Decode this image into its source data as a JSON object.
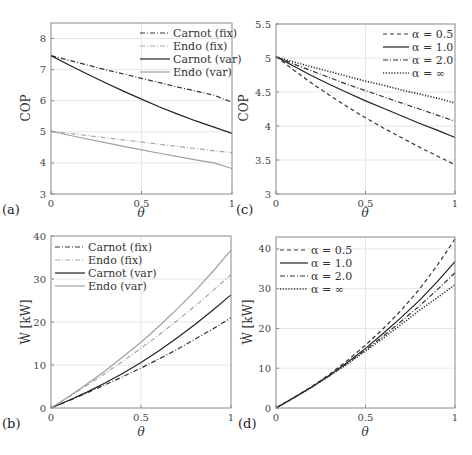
{
  "figure": {
    "width": 472,
    "height": 455,
    "grid_color": "#e6e6e6",
    "axes_color": "#8a8a8a"
  },
  "chart_data": [
    {
      "id": "a",
      "panel_label": "(a)",
      "type": "line",
      "title": "",
      "xlabel": "θ",
      "ylabel": "COP",
      "xlim": [
        0,
        1
      ],
      "ylim": [
        3,
        8.5
      ],
      "xticks": [
        0,
        0.5,
        1
      ],
      "xtick_labels": [
        "0",
        "0.5",
        "1"
      ],
      "yticks": [
        3,
        4,
        5,
        6,
        7,
        8
      ],
      "ytick_labels": [
        "3",
        "4",
        "5",
        "6",
        "7",
        "8"
      ],
      "grid": true,
      "legend_position": "upper right",
      "box": {
        "x0": 51,
        "x1": 232,
        "y0": 23,
        "y1": 194
      },
      "label_pos": {
        "x": 2,
        "y": 214
      },
      "xlabel_pos": {
        "x": 141,
        "y": 217
      },
      "ylabel_pos": {
        "x": 30,
        "y": 108
      },
      "legend_box": {
        "x": 140,
        "y": 27,
        "line_len": 30,
        "row_h": 13
      },
      "x": [
        0,
        0.1,
        0.2,
        0.3,
        0.4,
        0.5,
        0.6,
        0.7,
        0.8,
        0.9,
        1.0
      ],
      "series": [
        {
          "name": "Carnot (fix)",
          "style": "dashdot",
          "color": "#333333",
          "values": [
            7.45,
            7.3,
            7.15,
            7.0,
            6.86,
            6.72,
            6.58,
            6.44,
            6.31,
            6.18,
            5.95
          ]
        },
        {
          "name": "Endo (fix)",
          "style": "dashdot",
          "color": "#a8a8a8",
          "values": [
            5.02,
            4.95,
            4.88,
            4.81,
            4.74,
            4.67,
            4.6,
            4.53,
            4.46,
            4.39,
            4.33
          ]
        },
        {
          "name": "Carnot (var)",
          "style": "solid",
          "color": "#222222",
          "values": [
            7.45,
            7.15,
            6.86,
            6.58,
            6.31,
            6.05,
            5.8,
            5.57,
            5.35,
            5.15,
            4.95
          ]
        },
        {
          "name": "Endo (var)",
          "style": "solid",
          "color": "#a0a0a0",
          "values": [
            5.02,
            4.89,
            4.77,
            4.65,
            4.53,
            4.42,
            4.31,
            4.2,
            4.1,
            4.0,
            3.82
          ]
        }
      ]
    },
    {
      "id": "c",
      "panel_label": "(c)",
      "type": "line",
      "title": "",
      "xlabel": "θ",
      "ylabel": "COP",
      "xlim": [
        0,
        1
      ],
      "ylim": [
        3,
        5.5
      ],
      "xticks": [
        0,
        0.5,
        1
      ],
      "xtick_labels": [
        "0",
        "0.5",
        "1"
      ],
      "yticks": [
        3,
        3.5,
        4,
        4.5,
        5,
        5.5
      ],
      "ytick_labels": [
        "3",
        "3.5",
        "4",
        "4.5",
        "5",
        "5.5"
      ],
      "grid": true,
      "legend_position": "upper right",
      "box": {
        "x0": 276,
        "x1": 455,
        "y0": 24,
        "y1": 194
      },
      "label_pos": {
        "x": 236,
        "y": 214
      },
      "xlabel_pos": {
        "x": 365,
        "y": 217
      },
      "ylabel_pos": {
        "x": 248,
        "y": 108
      },
      "legend_box": {
        "x": 383,
        "y": 28,
        "line_len": 26,
        "row_h": 13
      },
      "x": [
        0,
        0.1,
        0.2,
        0.3,
        0.4,
        0.5,
        0.6,
        0.7,
        0.8,
        0.9,
        1.0
      ],
      "series": [
        {
          "name": "α = 0.5",
          "style": "dashed",
          "color": "#333333",
          "values": [
            5.02,
            4.82,
            4.63,
            4.45,
            4.28,
            4.12,
            3.97,
            3.83,
            3.69,
            3.56,
            3.43
          ]
        },
        {
          "name": "α = 1.0",
          "style": "solid",
          "color": "#222222",
          "values": [
            5.02,
            4.88,
            4.74,
            4.61,
            4.49,
            4.37,
            4.26,
            4.15,
            4.04,
            3.94,
            3.83
          ]
        },
        {
          "name": "α = 2.0",
          "style": "dashdot",
          "color": "#333333",
          "values": [
            5.02,
            4.91,
            4.81,
            4.71,
            4.61,
            4.52,
            4.43,
            4.34,
            4.25,
            4.16,
            4.07
          ]
        },
        {
          "name": "α = ∞",
          "style": "dotted",
          "color": "#333333",
          "values": [
            5.02,
            4.94,
            4.87,
            4.8,
            4.73,
            4.66,
            4.6,
            4.53,
            4.47,
            4.41,
            4.34
          ]
        }
      ]
    },
    {
      "id": "b",
      "panel_label": "(b)",
      "type": "line",
      "title": "",
      "xlabel": "θ",
      "ylabel": "Ẇ [kW]",
      "xlim": [
        0,
        1
      ],
      "ylim": [
        0,
        40
      ],
      "xticks": [
        0,
        0.5,
        1
      ],
      "xtick_labels": [
        "0",
        "0.5",
        "1"
      ],
      "yticks": [
        0,
        10,
        20,
        30,
        40
      ],
      "ytick_labels": [
        "0",
        "10",
        "20",
        "30",
        "40"
      ],
      "grid": true,
      "legend_position": "upper left",
      "box": {
        "x0": 51,
        "x1": 231,
        "y0": 236,
        "y1": 408
      },
      "label_pos": {
        "x": 2,
        "y": 428
      },
      "xlabel_pos": {
        "x": 141,
        "y": 436
      },
      "ylabel_pos": {
        "x": 30,
        "y": 322
      },
      "legend_box": {
        "x": 55,
        "y": 241,
        "line_len": 30,
        "row_h": 13
      },
      "x": [
        0,
        0.1,
        0.2,
        0.3,
        0.4,
        0.5,
        0.6,
        0.7,
        0.8,
        0.9,
        1.0
      ],
      "series": [
        {
          "name": "Carnot (fix)",
          "style": "dashdot",
          "color": "#333333",
          "values": [
            0,
            1.7,
            3.5,
            5.4,
            7.3,
            9.3,
            11.4,
            13.6,
            16.0,
            18.4,
            21.0
          ]
        },
        {
          "name": "Endo (fix)",
          "style": "dashdot",
          "color": "#a8a8a8",
          "values": [
            0,
            2.6,
            5.3,
            8.0,
            10.9,
            13.9,
            17.0,
            20.3,
            23.7,
            27.3,
            31.0
          ]
        },
        {
          "name": "Carnot (var)",
          "style": "solid",
          "color": "#222222",
          "values": [
            0,
            1.8,
            3.7,
            5.8,
            8.1,
            10.6,
            13.3,
            16.3,
            19.4,
            22.8,
            26.3
          ]
        },
        {
          "name": "Endo (var)",
          "style": "solid",
          "color": "#a0a0a0",
          "values": [
            0,
            2.7,
            5.6,
            8.6,
            11.9,
            15.3,
            19.0,
            23.0,
            27.2,
            31.8,
            36.7
          ]
        }
      ]
    },
    {
      "id": "d",
      "panel_label": "(d)",
      "type": "line",
      "title": "",
      "xlabel": "θ",
      "ylabel": "Ẇ [kW]",
      "xlim": [
        0,
        1
      ],
      "ylim": [
        0,
        43
      ],
      "xticks": [
        0,
        0.5,
        1
      ],
      "xtick_labels": [
        "0",
        "0.5",
        "1"
      ],
      "yticks": [
        0,
        10,
        20,
        30,
        40
      ],
      "ytick_labels": [
        "0",
        "10",
        "20",
        "30",
        "40"
      ],
      "grid": true,
      "legend_position": "upper left",
      "box": {
        "x0": 276,
        "x1": 455,
        "y0": 237,
        "y1": 408
      },
      "label_pos": {
        "x": 238,
        "y": 428
      },
      "xlabel_pos": {
        "x": 365,
        "y": 436
      },
      "ylabel_pos": {
        "x": 252,
        "y": 322
      },
      "legend_box": {
        "x": 280,
        "y": 244,
        "line_len": 28,
        "row_h": 13
      },
      "x": [
        0,
        0.1,
        0.2,
        0.3,
        0.4,
        0.5,
        0.6,
        0.7,
        0.8,
        0.9,
        1.0
      ],
      "series": [
        {
          "name": "α = 0.5",
          "style": "dashed",
          "color": "#333333",
          "values": [
            0,
            2.6,
            5.4,
            8.5,
            12.0,
            15.8,
            20.0,
            24.6,
            29.8,
            35.8,
            42.5
          ]
        },
        {
          "name": "α = 1.0",
          "style": "solid",
          "color": "#222222",
          "values": [
            0,
            2.6,
            5.3,
            8.3,
            11.5,
            15.0,
            18.8,
            22.8,
            27.0,
            31.7,
            36.8
          ]
        },
        {
          "name": "α = 2.0",
          "style": "dashdot",
          "color": "#333333",
          "values": [
            0,
            2.6,
            5.3,
            8.2,
            11.3,
            14.6,
            18.1,
            21.8,
            25.6,
            29.7,
            34.0
          ]
        },
        {
          "name": "α = ∞",
          "style": "dotted",
          "color": "#333333",
          "values": [
            0,
            2.6,
            5.2,
            8.1,
            11.1,
            14.3,
            17.6,
            21.0,
            24.5,
            27.7,
            31.0
          ]
        }
      ]
    }
  ]
}
